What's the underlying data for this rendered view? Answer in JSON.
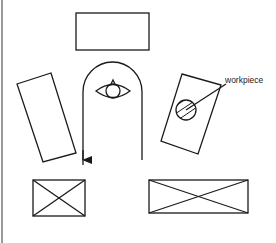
{
  "diagram": {
    "type": "robot workcell layout (top view)",
    "labels": {
      "workpiece": "workpiece"
    },
    "elements": [
      {
        "id": "top-station",
        "shape": "rectangle"
      },
      {
        "id": "left-station",
        "shape": "rotated-rectangle"
      },
      {
        "id": "right-station",
        "shape": "rotated-rectangle",
        "contains": "workpiece"
      },
      {
        "id": "robot",
        "shape": "top-view robot arm"
      },
      {
        "id": "robot-path",
        "shape": "U-shaped track with arrow"
      },
      {
        "id": "bottom-left-station",
        "shape": "crossed-box"
      },
      {
        "id": "bottom-right-station",
        "shape": "crossed-box"
      }
    ],
    "colors": {
      "stroke": "#1a1a1a",
      "background": "#ffffff"
    }
  }
}
